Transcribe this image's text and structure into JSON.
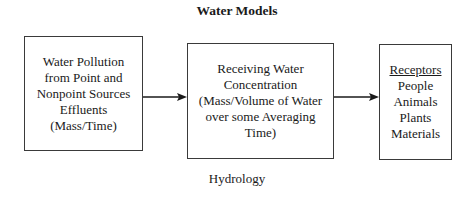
{
  "diagram": {
    "title": "Water Models",
    "footer_label": "Hydrology",
    "colors": {
      "stroke": "#3a3a3a",
      "text": "#1a1a1a",
      "background": "#ffffff"
    },
    "boxes": [
      {
        "id": "source",
        "lines": [
          "Water Pollution",
          "from Point and",
          "Nonpoint Sources",
          "Effluents",
          "(Mass/Time)"
        ]
      },
      {
        "id": "receiving",
        "lines": [
          "Receiving Water",
          "Concentration",
          "(Mass/Volume of Water",
          "over some Averaging",
          "Time)"
        ]
      },
      {
        "id": "receptors",
        "heading": "Receptors",
        "lines": [
          "People",
          "Animals",
          "Plants",
          "Materials"
        ]
      }
    ],
    "arrows": [
      {
        "from": "source",
        "to": "receiving"
      },
      {
        "from": "receiving",
        "to": "receptors"
      }
    ]
  }
}
